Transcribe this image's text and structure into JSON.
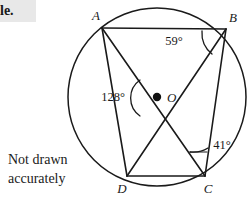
{
  "header": {
    "fragment_text": "le."
  },
  "note": {
    "line1": "Not drawn",
    "line2": "accurately"
  },
  "figure": {
    "center_label": "O",
    "vertices": [
      {
        "id": "A",
        "label": "A",
        "x": 102,
        "y": 28
      },
      {
        "id": "B",
        "label": "B",
        "x": 226,
        "y": 29
      },
      {
        "id": "C",
        "label": "C",
        "x": 205,
        "y": 176
      },
      {
        "id": "D",
        "label": "D",
        "x": 127,
        "y": 176
      }
    ],
    "vertex_label_positions": [
      {
        "id": "A",
        "x": 96,
        "y": 20
      },
      {
        "id": "B",
        "x": 231,
        "y": 22
      },
      {
        "id": "C",
        "x": 206,
        "y": 192
      },
      {
        "id": "D",
        "x": 121,
        "y": 192
      }
    ],
    "circle": {
      "cx": 157,
      "cy": 97,
      "r": 89
    },
    "angles": [
      {
        "id": "angle-at-B",
        "value": "59°",
        "label_x": 174,
        "label_y": 45
      },
      {
        "id": "angle-at-O",
        "value": "128°",
        "label_x": 113,
        "label_y": 101
      },
      {
        "id": "angle-at-C",
        "value": "41°",
        "label_x": 209,
        "label_y": 151
      }
    ],
    "chords": [
      {
        "from": "A",
        "to": "B"
      },
      {
        "from": "B",
        "to": "C"
      },
      {
        "from": "C",
        "to": "D"
      },
      {
        "from": "D",
        "to": "A"
      },
      {
        "from": "A",
        "to": "C"
      },
      {
        "from": "B",
        "to": "D"
      }
    ],
    "colors": {
      "ink": "#1a1a1a",
      "paper": "#ffffff",
      "band": "#e8e8e8"
    }
  }
}
